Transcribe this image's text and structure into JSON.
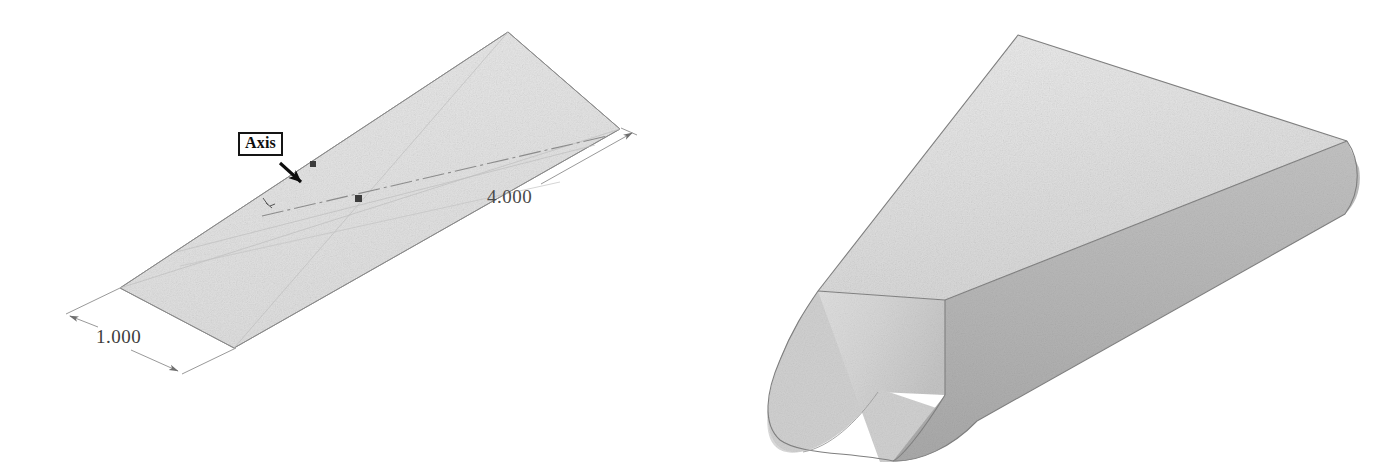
{
  "figure": {
    "kind": "cad-technical-illustration",
    "background_color": "#ffffff",
    "panels": [
      {
        "id": "sketch-panel",
        "name": "axis-sketch",
        "description": "Flat isometric sketch plane with revolve axis and dimensions"
      },
      {
        "id": "solid-panel",
        "name": "revolved-solid",
        "description": "Shaded 3D rounded prism resulting from the revolve"
      }
    ]
  },
  "sketch": {
    "plane_fill": "#e4e4e4",
    "plane_stroke": "#8d8d8d",
    "axis_line_color": "#9a9a9a",
    "point_marker_color": "#3c3c3c",
    "point_markers": 2,
    "callout": {
      "label": "Axis",
      "border_color": "#151515",
      "text_color": "#0e0e0e",
      "arrow_color": "#0d0d0d"
    },
    "dimensions": [
      {
        "name": "length-dimension",
        "value": "4.000",
        "placement": "upper-right",
        "line_color": "#8a8a8a",
        "text_color": "#4a4a4a"
      },
      {
        "name": "width-dimension",
        "value": "1.000",
        "placement": "lower-left",
        "line_color": "#8a8a8a",
        "text_color": "#3d3d3d"
      }
    ]
  },
  "solid": {
    "name": "rounded-prism",
    "top_face_color": "#e2e2e2",
    "side_face_color": "#b6b6b6",
    "end_cap_color": "#d6d6d6",
    "outline_color": "#7e7e7e",
    "has_rounded_end": true,
    "has_rounded_far_corner": true
  }
}
